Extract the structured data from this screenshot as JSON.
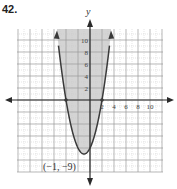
{
  "problem": {
    "number": "42."
  },
  "colors": {
    "shade": "#d4d4d4",
    "grid_major": "#9a9a9a",
    "grid_minor": "#c8c8c8",
    "curve": "#3a3a3a",
    "axis": "#2a2a2a"
  },
  "chart_data": {
    "type": "line",
    "title": "",
    "xlabel": "",
    "ylabel": "y",
    "equation": "y = (x + 1)^2 - 9",
    "inequality_shading": "inside parabola (y >= (x+1)^2 - 9)",
    "xlim": [
      -12,
      12
    ],
    "ylim": [
      -12,
      12
    ],
    "grid": true,
    "x_tick_labels": [
      "2",
      "4",
      "6",
      "8",
      "10"
    ],
    "x_ticks": [
      2,
      4,
      6,
      8,
      10
    ],
    "y_tick_labels": [
      "2",
      "4",
      "6",
      "8",
      "10"
    ],
    "y_ticks": [
      2,
      4,
      6,
      8,
      10
    ],
    "series": [
      {
        "name": "parabola",
        "x": [
          -5.5,
          -5,
          -4,
          -3,
          -2,
          -1,
          0,
          1,
          2,
          3,
          3.5
        ],
        "y": [
          11.25,
          7,
          0,
          -5,
          -8,
          -9,
          -8,
          -5,
          0,
          7,
          11.25
        ]
      }
    ],
    "key_points": [
      {
        "x": -4,
        "y": 0,
        "label": ""
      },
      {
        "x": 2,
        "y": 0,
        "label": ""
      },
      {
        "x": -1,
        "y": -9,
        "label": "(−1, −9)"
      }
    ],
    "annotations": [
      "(−1, −9)"
    ]
  }
}
